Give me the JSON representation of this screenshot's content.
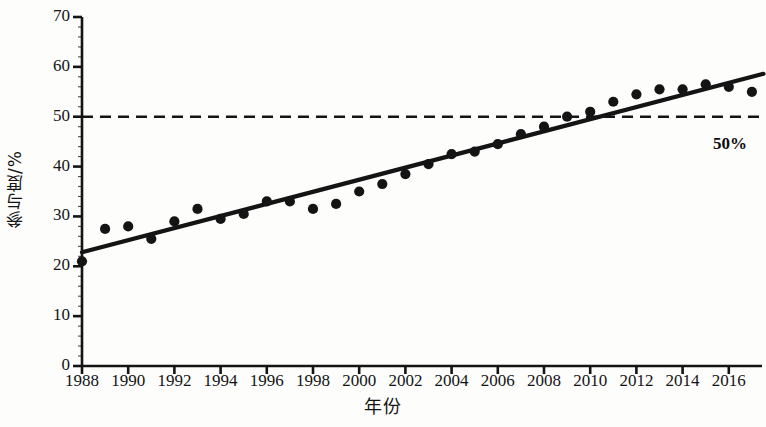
{
  "chart_data": {
    "type": "scatter",
    "title": "",
    "xlabel": "年份",
    "ylabel": "参与度/%",
    "xlim": [
      1987.5,
      2017.8
    ],
    "ylim": [
      0,
      70
    ],
    "grid": false,
    "legend": "none",
    "x_ticks": [
      1988,
      1990,
      1992,
      1994,
      1996,
      1998,
      2000,
      2002,
      2004,
      2006,
      2008,
      2010,
      2012,
      2014,
      2016
    ],
    "y_ticks": [
      0,
      10,
      20,
      30,
      40,
      50,
      60,
      70
    ],
    "x": [
      1988,
      1989,
      1990,
      1991,
      1992,
      1993,
      1994,
      1995,
      1996,
      1997,
      1998,
      1999,
      2000,
      2001,
      2002,
      2003,
      2004,
      2005,
      2006,
      2007,
      2008,
      2009,
      2010,
      2011,
      2012,
      2013,
      2014,
      2015,
      2016,
      2017
    ],
    "values": [
      21.0,
      27.5,
      28.0,
      25.5,
      29.0,
      31.5,
      29.5,
      30.5,
      33.0,
      33.0,
      31.5,
      32.5,
      35.0,
      36.5,
      38.5,
      40.5,
      42.5,
      43.0,
      44.5,
      46.5,
      48.0,
      50.0,
      51.0,
      53.0,
      54.5,
      55.5,
      55.5,
      56.5,
      56.0,
      55.0
    ],
    "series": [
      {
        "name": "参与度",
        "values": [
          21.0,
          27.5,
          28.0,
          25.5,
          29.0,
          31.5,
          29.5,
          30.5,
          33.0,
          33.0,
          31.5,
          32.5,
          35.0,
          36.5,
          38.5,
          40.5,
          42.5,
          43.0,
          44.5,
          46.5,
          48.0,
          50.0,
          51.0,
          53.0,
          54.5,
          55.5,
          55.5,
          56.5,
          56.0,
          55.0
        ]
      }
    ],
    "trend_line": {
      "type": "linear-fit",
      "x_start": 1988,
      "y_start": 22.8,
      "x_end": 2017.5,
      "y_end": 58.6
    },
    "reference_line": {
      "label": "50%",
      "value": 50,
      "style": "dashed",
      "orientation": "horizontal"
    },
    "marker": {
      "shape": "filled-circle",
      "color": "#141414",
      "size": 9
    },
    "colors": {
      "marker": "#141414",
      "trend": "#141414",
      "reference": "#141414",
      "axis": "#141414",
      "background": "#fdfdfc"
    }
  }
}
